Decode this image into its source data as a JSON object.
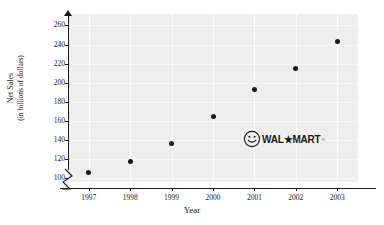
{
  "chart_data": {
    "type": "scatter",
    "title": "",
    "xlabel": "Year",
    "ylabel_line1": "Net Sales",
    "ylabel_line2": "(in billions of dollars)",
    "categories": [
      "1997",
      "1998",
      "1999",
      "2000",
      "2001",
      "2002",
      "2003"
    ],
    "values": [
      106,
      117,
      136,
      165,
      193,
      215,
      243
    ],
    "points": [
      {
        "x": "1997",
        "y": 106
      },
      {
        "x": "1998",
        "y": 117
      },
      {
        "x": "1999",
        "y": 136
      },
      {
        "x": "2000",
        "y": 165
      },
      {
        "x": "2001",
        "y": 193
      },
      {
        "x": "2002",
        "y": 215
      },
      {
        "x": "2003",
        "y": 243
      }
    ],
    "ytick_labels": [
      "260",
      "240",
      "220",
      "200",
      "180",
      "160",
      "140",
      "120",
      "100"
    ],
    "ytick_values": [
      260,
      240,
      220,
      200,
      180,
      160,
      140,
      120,
      100
    ],
    "ylim": [
      96,
      272
    ],
    "y_axis_broken": true,
    "grid": true,
    "legend": "none",
    "annotation": {
      "kind": "logo",
      "icon": "smiley-face-icon",
      "text": "WAL★MART",
      "trademark": "®"
    },
    "colors": {
      "plot_background": "#eeeeee",
      "gridline": "#fbfbfb",
      "marker": "#1a1a1a",
      "axis": "#1a1a1a",
      "page_background": "#ffffff"
    }
  }
}
